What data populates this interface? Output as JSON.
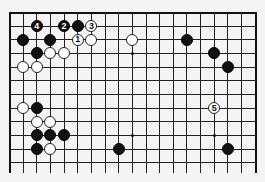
{
  "board": {
    "columns": 19,
    "rows_visible": 12,
    "origin_x": 9,
    "origin_y": 12,
    "spacing": 13.65,
    "line_extension_bottom": 11,
    "top_edge_visible": true,
    "left_edge_visible": true,
    "right_edge_visible": true,
    "bottom_edge_visible": false,
    "colors": {
      "line": "#222222",
      "black_stone": "#111111",
      "white_stone": "#ffffff",
      "background": "#f4f4f4"
    }
  },
  "star_points": [
    {
      "col": 9,
      "row": 3
    },
    {
      "col": 15,
      "row": 3
    },
    {
      "col": 3,
      "row": 9
    },
    {
      "col": 9,
      "row": 9
    },
    {
      "col": 15,
      "row": 9
    }
  ],
  "stones": [
    {
      "color": "black",
      "col": 2,
      "row": 1,
      "label": "4"
    },
    {
      "color": "black",
      "col": 4,
      "row": 1,
      "label": "2"
    },
    {
      "color": "black",
      "col": 5,
      "row": 1,
      "label": ""
    },
    {
      "color": "white",
      "col": 6,
      "row": 1,
      "label": "3"
    },
    {
      "color": "black",
      "col": 1,
      "row": 2,
      "label": ""
    },
    {
      "color": "black",
      "col": 3,
      "row": 2,
      "label": ""
    },
    {
      "color": "white",
      "col": 5,
      "row": 2,
      "label": "1"
    },
    {
      "color": "white",
      "col": 6,
      "row": 2,
      "label": ""
    },
    {
      "color": "white",
      "col": 9,
      "row": 2,
      "label": ""
    },
    {
      "color": "black",
      "col": 13,
      "row": 2,
      "label": ""
    },
    {
      "color": "black",
      "col": 2,
      "row": 3,
      "label": ""
    },
    {
      "color": "white",
      "col": 3,
      "row": 3,
      "label": ""
    },
    {
      "color": "white",
      "col": 4,
      "row": 3,
      "label": ""
    },
    {
      "color": "black",
      "col": 15,
      "row": 3,
      "label": ""
    },
    {
      "color": "white",
      "col": 1,
      "row": 4,
      "label": ""
    },
    {
      "color": "white",
      "col": 2,
      "row": 4,
      "label": ""
    },
    {
      "color": "black",
      "col": 16,
      "row": 4,
      "label": ""
    },
    {
      "color": "white",
      "col": 1,
      "row": 7,
      "label": ""
    },
    {
      "color": "black",
      "col": 2,
      "row": 7,
      "label": ""
    },
    {
      "color": "white",
      "col": 15,
      "row": 7,
      "label": "5"
    },
    {
      "color": "white",
      "col": 2,
      "row": 8,
      "label": ""
    },
    {
      "color": "white",
      "col": 3,
      "row": 8,
      "label": ""
    },
    {
      "color": "black",
      "col": 2,
      "row": 9,
      "label": ""
    },
    {
      "color": "black",
      "col": 3,
      "row": 9,
      "label": ""
    },
    {
      "color": "black",
      "col": 4,
      "row": 9,
      "label": ""
    },
    {
      "color": "black",
      "col": 2,
      "row": 10,
      "label": ""
    },
    {
      "color": "white",
      "col": 3,
      "row": 10,
      "label": ""
    },
    {
      "color": "black",
      "col": 8,
      "row": 10,
      "label": ""
    },
    {
      "color": "black",
      "col": 16,
      "row": 10,
      "label": ""
    }
  ]
}
